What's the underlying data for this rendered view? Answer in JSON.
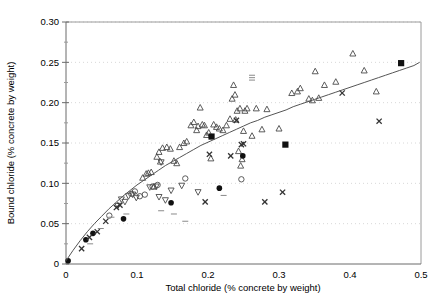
{
  "chart_data": {
    "type": "scatter",
    "title": "",
    "xlabel": "Total chloride (% concrete by weight)",
    "ylabel": "Bound chloride (% concrete by weight)",
    "xlim": [
      0,
      0.5
    ],
    "ylim": [
      0,
      0.3
    ],
    "xticks": [
      "0",
      "0.1",
      "0.2",
      "0.3",
      "0.4",
      "0.5"
    ],
    "xtick_values": [
      0,
      0.1,
      0.2,
      0.3,
      0.4,
      0.5
    ],
    "yticks": [
      "0",
      "0.05",
      "0.10",
      "0.15",
      "0.20",
      "0.25",
      "0.30"
    ],
    "ytick_values": [
      0,
      0.05,
      0.1,
      0.15,
      0.2,
      0.25,
      0.3
    ],
    "grid": "horizontal-dotted",
    "legend": "none",
    "minor_ticks_y": true,
    "fit_curve": {
      "name": "Langmuir binding isotherm fit",
      "points": [
        [
          0.0,
          0.004
        ],
        [
          0.01,
          0.017
        ],
        [
          0.02,
          0.029
        ],
        [
          0.03,
          0.04
        ],
        [
          0.04,
          0.05
        ],
        [
          0.05,
          0.059
        ],
        [
          0.06,
          0.068
        ],
        [
          0.07,
          0.076
        ],
        [
          0.08,
          0.084
        ],
        [
          0.09,
          0.091
        ],
        [
          0.1,
          0.098
        ],
        [
          0.11,
          0.104
        ],
        [
          0.12,
          0.11
        ],
        [
          0.13,
          0.116
        ],
        [
          0.14,
          0.122
        ],
        [
          0.15,
          0.127
        ],
        [
          0.16,
          0.132
        ],
        [
          0.17,
          0.137
        ],
        [
          0.18,
          0.142
        ],
        [
          0.19,
          0.147
        ],
        [
          0.2,
          0.151
        ],
        [
          0.21,
          0.155
        ],
        [
          0.22,
          0.159
        ],
        [
          0.23,
          0.163
        ],
        [
          0.24,
          0.167
        ],
        [
          0.25,
          0.171
        ],
        [
          0.26,
          0.175
        ],
        [
          0.27,
          0.178
        ],
        [
          0.28,
          0.182
        ],
        [
          0.29,
          0.185
        ],
        [
          0.3,
          0.188
        ],
        [
          0.31,
          0.191
        ],
        [
          0.32,
          0.195
        ],
        [
          0.33,
          0.198
        ],
        [
          0.34,
          0.201
        ],
        [
          0.35,
          0.204
        ],
        [
          0.36,
          0.207
        ],
        [
          0.37,
          0.21
        ],
        [
          0.38,
          0.213
        ],
        [
          0.39,
          0.216
        ],
        [
          0.4,
          0.219
        ],
        [
          0.41,
          0.222
        ],
        [
          0.42,
          0.225
        ],
        [
          0.43,
          0.228
        ],
        [
          0.44,
          0.231
        ],
        [
          0.45,
          0.234
        ],
        [
          0.46,
          0.237
        ],
        [
          0.47,
          0.24
        ],
        [
          0.48,
          0.243
        ],
        [
          0.49,
          0.246
        ],
        [
          0.498,
          0.25
        ]
      ]
    },
    "series": [
      {
        "name": "Series A (open up-triangle)",
        "marker": "triangle-up-open",
        "points": [
          [
            0.108,
            0.107
          ],
          [
            0.113,
            0.112
          ],
          [
            0.116,
            0.113
          ],
          [
            0.12,
            0.114
          ],
          [
            0.124,
            0.096
          ],
          [
            0.128,
            0.133
          ],
          [
            0.131,
            0.139
          ],
          [
            0.133,
            0.127
          ],
          [
            0.136,
            0.144
          ],
          [
            0.142,
            0.145
          ],
          [
            0.147,
            0.143
          ],
          [
            0.152,
            0.128
          ],
          [
            0.156,
            0.125
          ],
          [
            0.16,
            0.145
          ],
          [
            0.166,
            0.15
          ],
          [
            0.17,
            0.152
          ],
          [
            0.176,
            0.172
          ],
          [
            0.18,
            0.176
          ],
          [
            0.184,
            0.166
          ],
          [
            0.186,
            0.171
          ],
          [
            0.189,
            0.194
          ],
          [
            0.192,
            0.173
          ],
          [
            0.195,
            0.172
          ],
          [
            0.198,
            0.16
          ],
          [
            0.201,
            0.163
          ],
          [
            0.204,
            0.131
          ],
          [
            0.208,
            0.173
          ],
          [
            0.212,
            0.17
          ],
          [
            0.216,
            0.168
          ],
          [
            0.221,
            0.166
          ],
          [
            0.226,
            0.172
          ],
          [
            0.231,
            0.18
          ],
          [
            0.234,
            0.205
          ],
          [
            0.236,
            0.222
          ],
          [
            0.238,
            0.21
          ],
          [
            0.239,
            0.179
          ],
          [
            0.241,
            0.19
          ],
          [
            0.243,
            0.14
          ],
          [
            0.245,
            0.193
          ],
          [
            0.246,
            0.122
          ],
          [
            0.248,
            0.13
          ],
          [
            0.25,
            0.165
          ],
          [
            0.252,
            0.19
          ],
          [
            0.255,
            0.193
          ],
          [
            0.262,
            0.159
          ],
          [
            0.268,
            0.193
          ],
          [
            0.276,
            0.167
          ],
          [
            0.283,
            0.192
          ],
          [
            0.3,
            0.168
          ],
          [
            0.318,
            0.212
          ],
          [
            0.326,
            0.214
          ],
          [
            0.33,
            0.218
          ],
          [
            0.342,
            0.205
          ],
          [
            0.347,
            0.203
          ],
          [
            0.351,
            0.239
          ],
          [
            0.356,
            0.206
          ],
          [
            0.364,
            0.222
          ],
          [
            0.38,
            0.226
          ],
          [
            0.404,
            0.261
          ],
          [
            0.42,
            0.24
          ],
          [
            0.437,
            0.214
          ]
        ]
      },
      {
        "name": "Series B (open down-triangle)",
        "marker": "triangle-down-open",
        "points": [
          [
            0.073,
            0.072
          ],
          [
            0.078,
            0.08
          ],
          [
            0.083,
            0.077
          ],
          [
            0.088,
            0.084
          ],
          [
            0.094,
            0.086
          ],
          [
            0.099,
            0.082
          ],
          [
            0.118,
            0.095
          ],
          [
            0.127,
            0.096
          ],
          [
            0.131,
            0.083
          ],
          [
            0.134,
            0.126
          ],
          [
            0.14,
            0.079
          ],
          [
            0.148,
            0.091
          ],
          [
            0.163,
            0.097
          ],
          [
            0.186,
            0.089
          ]
        ]
      },
      {
        "name": "Series C (open circle)",
        "marker": "circle-open",
        "points": [
          [
            0.092,
            0.087
          ],
          [
            0.097,
            0.09
          ],
          [
            0.104,
            0.084
          ],
          [
            0.111,
            0.086
          ],
          [
            0.122,
            0.096
          ],
          [
            0.129,
            0.098
          ],
          [
            0.168,
            0.106
          ],
          [
            0.247,
            0.105
          ],
          [
            0.061,
            0.06
          ]
        ]
      },
      {
        "name": "Series D (filled square)",
        "marker": "square-filled",
        "points": [
          [
            0.205,
            0.158
          ],
          [
            0.309,
            0.148
          ],
          [
            0.472,
            0.249
          ]
        ]
      },
      {
        "name": "Series E (filled circle)",
        "marker": "circle-filled",
        "points": [
          [
            0.003,
            0.004
          ],
          [
            0.028,
            0.03
          ],
          [
            0.038,
            0.038
          ],
          [
            0.081,
            0.056
          ],
          [
            0.148,
            0.076
          ],
          [
            0.216,
            0.094
          ],
          [
            0.249,
            0.134
          ]
        ]
      },
      {
        "name": "Series F (cross / x-mark)",
        "marker": "cross",
        "points": [
          [
            0.022,
            0.019
          ],
          [
            0.033,
            0.033
          ],
          [
            0.044,
            0.04
          ],
          [
            0.056,
            0.053
          ],
          [
            0.071,
            0.07
          ],
          [
            0.076,
            0.073
          ],
          [
            0.202,
            0.136
          ],
          [
            0.232,
            0.134
          ],
          [
            0.24,
            0.178
          ],
          [
            0.247,
            0.148
          ],
          [
            0.25,
            0.149
          ],
          [
            0.196,
            0.077
          ],
          [
            0.28,
            0.077
          ],
          [
            0.305,
            0.089
          ],
          [
            0.389,
            0.212
          ],
          [
            0.441,
            0.177
          ]
        ]
      },
      {
        "name": "Series G (short dash)",
        "marker": "dash",
        "points": [
          [
            0.034,
            0.025
          ],
          [
            0.049,
            0.044
          ],
          [
            0.064,
            0.058
          ],
          [
            0.085,
            0.062
          ],
          [
            0.134,
            0.066
          ],
          [
            0.152,
            0.062
          ],
          [
            0.222,
            0.085
          ],
          [
            0.262,
            0.228
          ],
          [
            0.262,
            0.231
          ],
          [
            0.262,
            0.234
          ],
          [
            0.168,
            0.053
          ]
        ]
      }
    ]
  },
  "axes": {
    "x_title": "Total chloride (% concrete by weight)",
    "y_title": "Bound chloride (% concrete by weight)"
  }
}
